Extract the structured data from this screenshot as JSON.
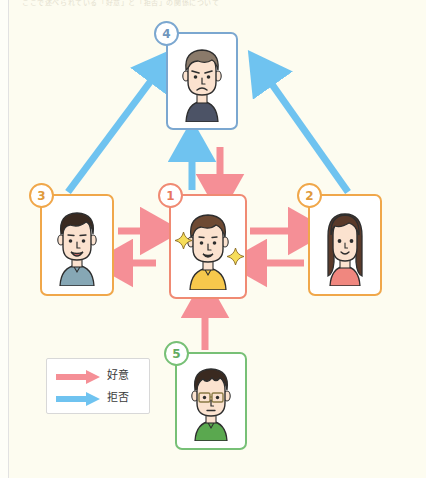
{
  "caption": {
    "text": "ここで述べられている「好意」と「拒否」の関係について"
  },
  "colors": {
    "background": "#fdfcf0",
    "favor_arrow": "#f58f96",
    "reject_arrow": "#6fc3f0",
    "card_border_center": "#f08a73",
    "card_border_orange": "#f0a74a",
    "card_border_blue": "#7ba7d0",
    "card_border_green": "#77c076"
  },
  "legend": {
    "items": [
      {
        "label": "好意",
        "arrow_icon": "arrow-right-icon",
        "color": "#f58f96"
      },
      {
        "label": "拒否",
        "arrow_icon": "arrow-right-icon",
        "color": "#6fc3f0"
      }
    ]
  },
  "nodes": [
    {
      "id": "1",
      "badge": "1",
      "border_color": "#f08a73",
      "badge_color": "#f08a73",
      "person": "smiling-person-yellow-shirt",
      "hair": "#6e4a33",
      "shirt": "#f6c84c",
      "skin": "#fbe2cf",
      "expression": "smile",
      "highlighted": true
    },
    {
      "id": "2",
      "badge": "2",
      "border_color": "#f0a74a",
      "badge_color": "#f0a74a",
      "person": "long-hair-woman-pink-top",
      "hair": "#5a3a2a",
      "shirt": "#f0877f",
      "skin": "#fbe2cf",
      "expression": "smile",
      "highlighted": false
    },
    {
      "id": "3",
      "badge": "3",
      "border_color": "#f0a74a",
      "badge_color": "#f0a74a",
      "person": "smiling-man-blue-shirt",
      "hair": "#3a2a20",
      "shirt": "#86a7b5",
      "skin": "#fbe2cf",
      "expression": "open-smile",
      "highlighted": false
    },
    {
      "id": "4",
      "badge": "4",
      "border_color": "#7ba7d0",
      "badge_color": "#7ba7d0",
      "person": "frowning-man-navy-shirt",
      "hair": "#8a7a6a",
      "shirt": "#4c5366",
      "skin": "#fbe2cf",
      "expression": "frown",
      "highlighted": false
    },
    {
      "id": "5",
      "badge": "5",
      "border_color": "#77c076",
      "badge_color": "#77c076",
      "person": "glasses-man-green-shirt",
      "hair": "#3a2a20",
      "shirt": "#5aa84f",
      "skin": "#fbe2cf",
      "expression": "neutral",
      "highlighted": false
    }
  ],
  "edges": [
    {
      "from": "3",
      "to": "1",
      "type": "好意",
      "color": "#f58f96",
      "direction": "right"
    },
    {
      "from": "1",
      "to": "3",
      "type": "好意",
      "color": "#f58f96",
      "direction": "left"
    },
    {
      "from": "1",
      "to": "2",
      "type": "好意",
      "color": "#f58f96",
      "direction": "right"
    },
    {
      "from": "2",
      "to": "1",
      "type": "好意",
      "color": "#f58f96",
      "direction": "left"
    },
    {
      "from": "1",
      "to": "4",
      "type": "拒否",
      "color": "#6fc3f0",
      "direction": "up"
    },
    {
      "from": "4",
      "to": "1",
      "type": "好意",
      "color": "#f58f96",
      "direction": "down"
    },
    {
      "from": "5",
      "to": "1",
      "type": "好意",
      "color": "#f58f96",
      "direction": "up"
    },
    {
      "from": "3",
      "to": "4",
      "type": "拒否",
      "color": "#6fc3f0",
      "direction": "up-right"
    },
    {
      "from": "2",
      "to": "4",
      "type": "拒否",
      "color": "#6fc3f0",
      "direction": "up-left"
    }
  ]
}
